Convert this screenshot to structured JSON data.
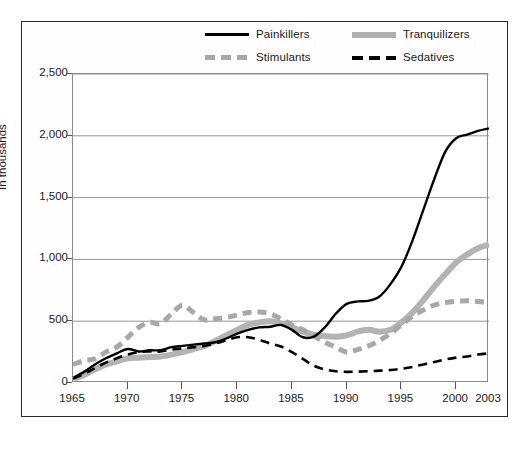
{
  "chart_data": {
    "type": "line",
    "title": "",
    "subtitle": "",
    "xlabel": "",
    "ylabel": "In thousands",
    "xlim": [
      1965,
      2003
    ],
    "ylim": [
      0,
      2500
    ],
    "grid": "horizontal",
    "legend_position": "top-center",
    "x_ticks": [
      "1965",
      "1970",
      "1975",
      "1980",
      "1985",
      "1990",
      "1995",
      "2000",
      "2003"
    ],
    "x_tick_values": [
      1965,
      1970,
      1975,
      1980,
      1985,
      1990,
      1995,
      2000,
      2003
    ],
    "y_ticks": [
      "0",
      "500",
      "1,000",
      "1,500",
      "2,000",
      "2,500"
    ],
    "y_tick_values": [
      0,
      500,
      1000,
      1500,
      2000,
      2500
    ],
    "x": [
      1965,
      1966,
      1967,
      1968,
      1969,
      1970,
      1971,
      1972,
      1973,
      1974,
      1975,
      1976,
      1977,
      1978,
      1979,
      1980,
      1981,
      1982,
      1983,
      1984,
      1985,
      1986,
      1987,
      1988,
      1989,
      1990,
      1991,
      1992,
      1993,
      1994,
      1995,
      1996,
      1997,
      1998,
      1999,
      2000,
      2001,
      2002,
      2003
    ],
    "series": [
      {
        "name": "Painkillers",
        "style": "solid",
        "color": "#000000",
        "width": 2.4,
        "values": [
          40,
          90,
          150,
          200,
          240,
          275,
          255,
          265,
          265,
          290,
          300,
          310,
          320,
          330,
          360,
          400,
          430,
          450,
          455,
          470,
          430,
          370,
          375,
          450,
          560,
          640,
          660,
          665,
          700,
          800,
          940,
          1150,
          1400,
          1650,
          1870,
          1980,
          2010,
          2040,
          2060
        ]
      },
      {
        "name": "Tranquilizers",
        "style": "solid",
        "color": "#b3b3b3",
        "width": 6,
        "values": [
          30,
          65,
          110,
          150,
          175,
          200,
          205,
          210,
          215,
          230,
          250,
          275,
          300,
          340,
          385,
          430,
          470,
          490,
          500,
          480,
          450,
          415,
          390,
          380,
          375,
          385,
          415,
          430,
          415,
          430,
          490,
          570,
          670,
          780,
          880,
          975,
          1040,
          1090,
          1120
        ]
      },
      {
        "name": "Stimulants",
        "style": "dashed",
        "color": "#a8a8a8",
        "width": 5,
        "values": [
          150,
          180,
          195,
          250,
          290,
          370,
          450,
          490,
          480,
          560,
          630,
          570,
          510,
          520,
          530,
          550,
          570,
          575,
          560,
          520,
          470,
          430,
          380,
          330,
          290,
          250,
          270,
          300,
          345,
          400,
          470,
          540,
          590,
          630,
          650,
          660,
          665,
          660,
          650
        ]
      },
      {
        "name": "Sedatives",
        "style": "dashed",
        "color": "#000000",
        "width": 2.6,
        "values": [
          35,
          75,
          120,
          165,
          200,
          230,
          250,
          255,
          255,
          270,
          280,
          290,
          300,
          320,
          345,
          370,
          370,
          350,
          320,
          295,
          250,
          195,
          140,
          110,
          95,
          90,
          92,
          95,
          100,
          105,
          115,
          130,
          150,
          170,
          190,
          205,
          215,
          230,
          240
        ]
      }
    ]
  },
  "legend": {
    "items": [
      {
        "label": "Painkillers",
        "swatch": "solid-black-line-swatch",
        "icon": "line-solid-icon"
      },
      {
        "label": "Tranquilizers",
        "swatch": "solid-gray-line-swatch",
        "icon": "line-thick-icon"
      },
      {
        "label": "Stimulants",
        "swatch": "dashed-gray-line-swatch",
        "icon": "line-dashed-icon"
      },
      {
        "label": "Sedatives",
        "swatch": "dashed-black-line-swatch",
        "icon": "line-dashed-icon"
      }
    ]
  }
}
